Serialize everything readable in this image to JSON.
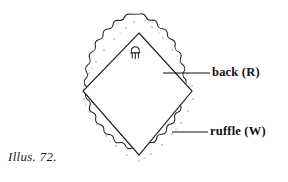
{
  "figure": {
    "caption": "Illus. 72.",
    "ink_color": "#1a1a1a",
    "fill_color": "#ffffff",
    "speckle_color": "#9a9a9a",
    "labels": [
      {
        "id": "back",
        "text": "back (R)",
        "leader_from_x": 163,
        "leader_to_x": 210,
        "leader_y": 73
      },
      {
        "id": "ruffle",
        "text": "ruffle (W)",
        "leader_from_x": 172,
        "leader_to_x": 208,
        "leader_y": 132
      }
    ],
    "shape": {
      "type": "ruffled-diamond-pillow",
      "outer_scallop_points": [
        140,
        15,
        207,
        90,
        140,
        170,
        73,
        90
      ],
      "inner_diamond_points": [
        139,
        33,
        192,
        91,
        139,
        155,
        83,
        91
      ],
      "scallop_count": 44
    },
    "ornament": {
      "name": "hanging-loop",
      "x": 135,
      "y": 52
    }
  }
}
